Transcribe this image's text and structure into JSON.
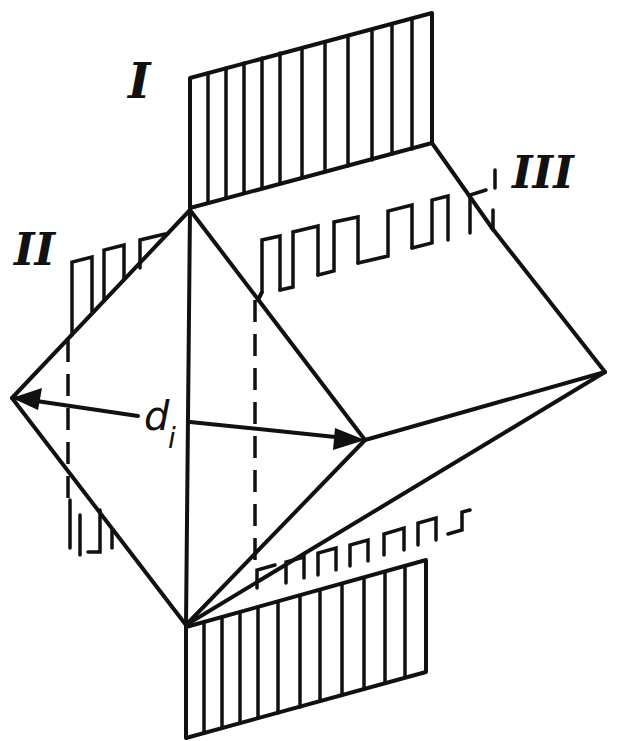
{
  "figure": {
    "type": "crystal geometry diagram",
    "labels": {
      "plane_I": "I",
      "plane_II": "II",
      "plane_III": "III",
      "diagonal_symbol": "d",
      "diagonal_subscript": "i"
    },
    "colors": {
      "ink": "#111111",
      "background": "#ffffff"
    }
  }
}
